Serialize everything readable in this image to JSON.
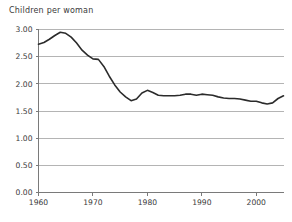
{
  "chart_data": {
    "type": "line",
    "title": "Children per woman",
    "xlabel": "",
    "ylabel": "",
    "xlim": [
      1960,
      2005
    ],
    "ylim": [
      0.0,
      3.0
    ],
    "grid": true,
    "legend": false,
    "y_ticks": [
      "0.00",
      "0.50",
      "1.00",
      "1.50",
      "2.00",
      "2.50",
      "3.00"
    ],
    "y_tick_values": [
      0.0,
      0.5,
      1.0,
      1.5,
      2.0,
      2.5,
      3.0
    ],
    "x_ticks": [
      "1960",
      "1970",
      "1980",
      "1990",
      "2000"
    ],
    "x_tick_values": [
      1960,
      1970,
      1980,
      1990,
      2000
    ],
    "series": [
      {
        "name": "Total fertility rate",
        "color": "#2b2b2b",
        "x": [
          1960,
          1961,
          1962,
          1963,
          1964,
          1965,
          1966,
          1967,
          1968,
          1969,
          1970,
          1971,
          1972,
          1973,
          1974,
          1975,
          1976,
          1977,
          1978,
          1979,
          1980,
          1981,
          1982,
          1983,
          1984,
          1985,
          1986,
          1987,
          1988,
          1989,
          1990,
          1991,
          1992,
          1993,
          1994,
          1995,
          1996,
          1997,
          1998,
          1999,
          2000,
          2001,
          2002,
          2003,
          2004,
          2005
        ],
        "values": [
          2.73,
          2.76,
          2.82,
          2.89,
          2.95,
          2.93,
          2.86,
          2.75,
          2.62,
          2.53,
          2.46,
          2.45,
          2.32,
          2.14,
          1.98,
          1.85,
          1.76,
          1.69,
          1.72,
          1.83,
          1.88,
          1.84,
          1.79,
          1.78,
          1.78,
          1.78,
          1.79,
          1.81,
          1.81,
          1.79,
          1.81,
          1.8,
          1.79,
          1.76,
          1.74,
          1.73,
          1.73,
          1.72,
          1.7,
          1.68,
          1.68,
          1.65,
          1.63,
          1.65,
          1.73,
          1.78
        ]
      }
    ]
  },
  "colors": {
    "series": "#2b2b2b",
    "gridline": "#b4b4b4",
    "axis": "#7a7a7a",
    "text": "#3a3a3a",
    "background": "#ffffff"
  }
}
